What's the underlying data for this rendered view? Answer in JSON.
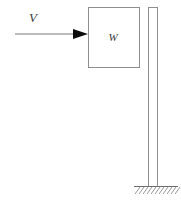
{
  "figure": {
    "canvas": {
      "width": 181,
      "height": 202,
      "background": "#ffffff"
    },
    "velocity_arrow": {
      "label": "V",
      "label_x": 33,
      "label_y": 22,
      "line_start_x": 15,
      "line_start_y": 34,
      "line_end_x": 74,
      "line_end_y": 34,
      "head_tip_x": 88,
      "head_tip_y": 34,
      "head_back_x": 73,
      "head_half_height": 5,
      "stroke_color": "#7a7a7a",
      "head_color": "#0d0d0d"
    },
    "block": {
      "label": "W",
      "x": 88,
      "y": 7,
      "width": 51,
      "height": 60,
      "label_x": 113,
      "label_y": 41,
      "stroke_color": "#8e8e8e",
      "fill": "none"
    },
    "post": {
      "left_x": 148,
      "right_x": 157,
      "top_y": 7,
      "bottom_y": 186,
      "stroke_color": "#8e8e8e"
    },
    "ground": {
      "line_start_x": 134,
      "line_end_x": 178,
      "line_y": 186,
      "hatch_count": 11,
      "hatch_spacing": 4,
      "hatch_length": 7,
      "hatch_dx": -5,
      "hatch_dy": 7,
      "stroke_color": "#8a8a8a"
    }
  }
}
